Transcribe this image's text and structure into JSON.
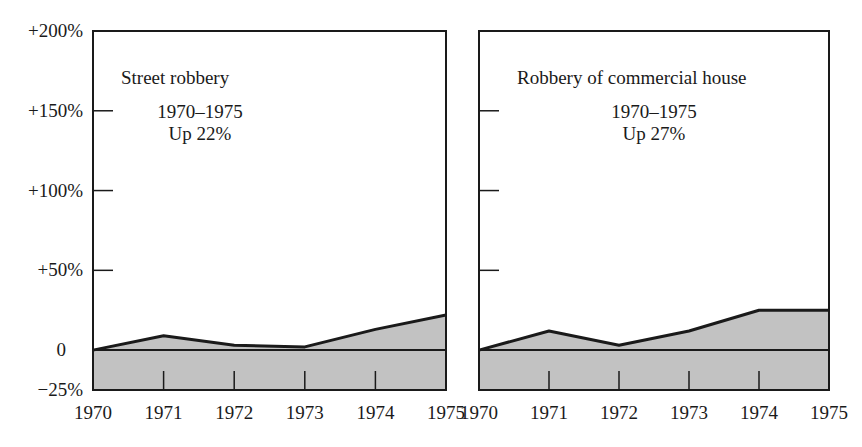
{
  "figure": {
    "caption_partial": "Figure: Robbery by Type, 1970–1975"
  },
  "colors": {
    "fill": "#c2c2c2",
    "line": "#1a1a1a",
    "frame": "#1a1a1a",
    "background": "#ffffff"
  },
  "y_axis": {
    "tick_labels": [
      "+200%",
      "+150%",
      "+100%",
      "+50%",
      "0",
      "−25%"
    ],
    "tick_values": [
      200,
      150,
      100,
      50,
      0,
      -25
    ]
  },
  "chart_data": [
    {
      "type": "area",
      "title": "Street robbery",
      "annotation_line1": "1970–1975",
      "annotation_line2": "Up 22%",
      "xlabel": "",
      "ylabel": "",
      "x": [
        "1970",
        "1971",
        "1972",
        "1973",
        "1974",
        "1975"
      ],
      "values": [
        0,
        9,
        3,
        2,
        13,
        22
      ],
      "ylim": [
        -25,
        200
      ],
      "grid": false,
      "legend": "none"
    },
    {
      "type": "area",
      "title": "Robbery of commercial house",
      "annotation_line1": "1970–1975",
      "annotation_line2": "Up 27%",
      "xlabel": "",
      "ylabel": "",
      "x": [
        "1970",
        "1971",
        "1972",
        "1973",
        "1974",
        "1975"
      ],
      "values": [
        0,
        12,
        3,
        12,
        25,
        25
      ],
      "ylim": [
        -25,
        200
      ],
      "grid": false,
      "legend": "none"
    }
  ]
}
